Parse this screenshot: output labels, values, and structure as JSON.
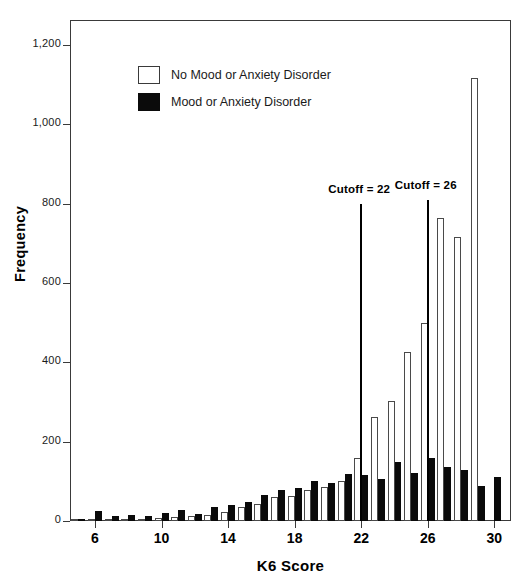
{
  "chart_data": {
    "type": "bar",
    "title": "",
    "xlabel": "K6 Score",
    "ylabel": "Frequency",
    "xlim": [
      4.5,
      31
    ],
    "ylim": [
      0,
      1260
    ],
    "grid": false,
    "legend_position": "upper-left-inside",
    "x_ticks": [
      6,
      10,
      14,
      18,
      22,
      26,
      30
    ],
    "x_tick_labels": [
      "6",
      "10",
      "14",
      "18",
      "22",
      "26",
      "30"
    ],
    "y_ticks": [
      0,
      200,
      400,
      600,
      800,
      1000,
      1200
    ],
    "y_tick_labels": [
      "0",
      "200",
      "400",
      "600",
      "800",
      "1,000",
      "1,200"
    ],
    "categories": [
      5,
      6,
      7,
      8,
      9,
      10,
      11,
      12,
      13,
      14,
      15,
      16,
      17,
      18,
      19,
      20,
      21,
      22,
      23,
      24,
      25,
      26,
      27,
      28,
      29,
      30
    ],
    "series": [
      {
        "name": "No Mood or Anxiety Disorder",
        "color": "#ffffff",
        "values": [
          2,
          3,
          4,
          5,
          6,
          8,
          10,
          12,
          14,
          22,
          35,
          44,
          60,
          62,
          78,
          85,
          100,
          158,
          262,
          303,
          425,
          500,
          765,
          715,
          1118,
          0
        ]
      },
      {
        "name": "Mood or Anxiety Disorder",
        "color": "#0a0a0a",
        "values": [
          5,
          25,
          12,
          15,
          12,
          20,
          28,
          18,
          35,
          40,
          48,
          65,
          78,
          83,
          102,
          95,
          118,
          115,
          105,
          148,
          120,
          158,
          135,
          128,
          88,
          112
        ]
      }
    ],
    "annotations": [
      {
        "name": "cutoff-22",
        "label": "Cutoff = 22",
        "x": 22,
        "y_top": 800
      },
      {
        "name": "cutoff-26",
        "label": "Cutoff = 26",
        "x": 26,
        "y_top": 808
      }
    ]
  },
  "legend": {
    "items": [
      {
        "label": "No Mood or Anxiety Disorder",
        "swatch": "white"
      },
      {
        "label": "Mood or Anxiety Disorder",
        "swatch": "black"
      }
    ]
  }
}
